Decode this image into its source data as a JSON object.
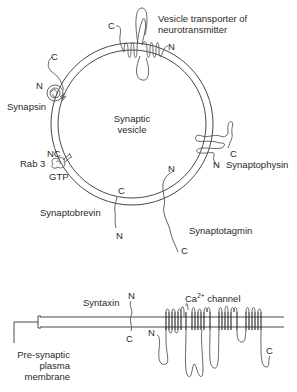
{
  "diagram": {
    "vesicle": {
      "label_line1": "Synaptic",
      "label_line2": "vesicle"
    },
    "proteins": {
      "vesicle_transporter": {
        "label_line1": "Vesicle transporter of",
        "label_line2": "neurotransmitter",
        "c_terminal": "C",
        "n_terminal": "N"
      },
      "synapsin": {
        "label": "Synapsin",
        "c_terminal": "C",
        "n_terminal": "N"
      },
      "rab3": {
        "label": "Rab 3",
        "terminals": "NC",
        "bound": "GTP"
      },
      "synaptobrevin": {
        "label": "Synaptobrevin",
        "c_terminal": "C",
        "n_terminal": "N"
      },
      "synaptophysin": {
        "label": "Synaptophysin",
        "c_terminal": "C",
        "n_terminal": "N"
      },
      "synaptotagmin": {
        "label": "Synaptotagmin",
        "c_terminal": "C",
        "n_terminal": "N"
      },
      "syntaxin": {
        "label": "Syntaxin",
        "c_terminal": "C",
        "n_terminal": "N"
      },
      "ca_channel": {
        "label_prefix": "Ca",
        "label_superscript": "2+",
        "label_suffix": " channel",
        "c_terminal": "C",
        "n_terminal": "N"
      }
    },
    "plasma_membrane": {
      "label_line1": "Pre-synaptic",
      "label_line2": "plasma",
      "label_line3": "membrane"
    },
    "colors": {
      "line": "#333333",
      "protein": "#555555",
      "text": "#2a2a2a",
      "background": "#ffffff"
    }
  }
}
